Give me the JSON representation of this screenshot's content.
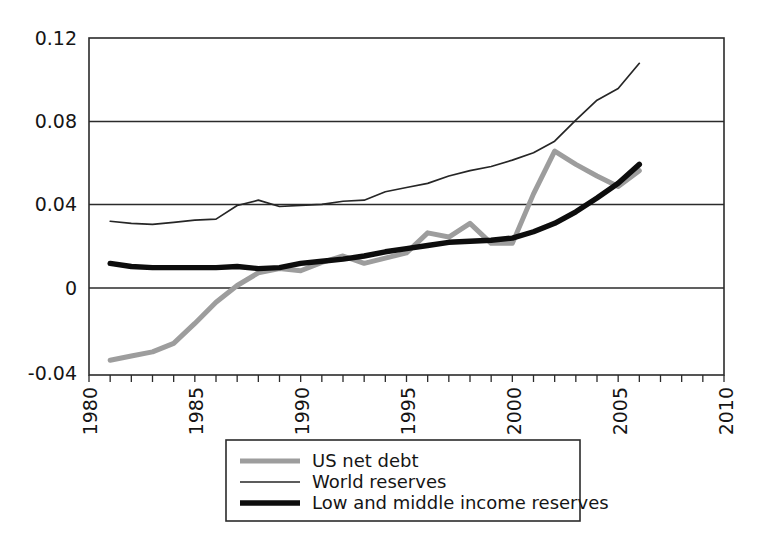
{
  "chart_data": {
    "type": "line",
    "title": "",
    "subtitle": "",
    "xlabel": "",
    "ylabel": "",
    "xlim": [
      1980,
      2010
    ],
    "ylim": [
      -0.04,
      0.12
    ],
    "grid": true,
    "grid_axis": "y",
    "legend_position": "below-center",
    "x_ticks": [
      1980,
      1985,
      1990,
      1995,
      2000,
      2005,
      2010
    ],
    "x_tick_labels": [
      "1980",
      "1985",
      "1990",
      "1995",
      "2000",
      "2005",
      "2010"
    ],
    "x_minor_tick_step": 1,
    "x_tick_label_rotation": 90,
    "y_ticks": [
      -0.04,
      0,
      0.04,
      0.08,
      0.12
    ],
    "y_tick_labels": [
      "-0.04",
      "0",
      "0.04",
      "0.08",
      "0.12"
    ],
    "series": [
      {
        "name": "US net debt",
        "color": "#9d9d9d",
        "width": 5.0,
        "x": [
          1981,
          1982,
          1983,
          1984,
          1985,
          1986,
          1987,
          1988,
          1989,
          1990,
          1991,
          1992,
          1993,
          1994,
          1995,
          1996,
          1997,
          1998,
          1999,
          2000,
          2001,
          2002,
          2003,
          2004,
          2005,
          2006
        ],
        "values": [
          -0.033,
          -0.031,
          -0.029,
          -0.025,
          -0.0155,
          -0.0055,
          0.0025,
          0.0085,
          0.0105,
          0.0095,
          0.0135,
          0.0165,
          0.013,
          0.0155,
          0.018,
          0.0275,
          0.0255,
          0.032,
          0.0225,
          0.0225,
          0.046,
          0.0663,
          0.06,
          0.0545,
          0.0495,
          0.057
        ]
      },
      {
        "name": "World reserves",
        "color": "#262626",
        "width": 1.7,
        "x": [
          1981,
          1982,
          1983,
          1984,
          1985,
          1986,
          1987,
          1988,
          1989,
          1990,
          1991,
          1992,
          1993,
          1994,
          1995,
          1996,
          1997,
          1998,
          1999,
          2000,
          2001,
          2002,
          2003,
          2004,
          2005,
          2006
        ],
        "values": [
          0.033,
          0.032,
          0.0315,
          0.0325,
          0.0335,
          0.034,
          0.0405,
          0.043,
          0.04,
          0.0405,
          0.041,
          0.0425,
          0.043,
          0.047,
          0.049,
          0.051,
          0.0545,
          0.057,
          0.059,
          0.062,
          0.0655,
          0.071,
          0.081,
          0.0905,
          0.096,
          0.108
        ]
      },
      {
        "name": "Low and middle income reserves",
        "color": "#0d0d0d",
        "width": 5.4,
        "x": [
          1981,
          1982,
          1983,
          1984,
          1985,
          1986,
          1987,
          1988,
          1989,
          1990,
          1991,
          1992,
          1993,
          1994,
          1995,
          1996,
          1997,
          1998,
          1999,
          2000,
          2001,
          2002,
          2003,
          2004,
          2005,
          2006
        ],
        "values": [
          0.013,
          0.0115,
          0.011,
          0.011,
          0.011,
          0.011,
          0.0115,
          0.0105,
          0.011,
          0.013,
          0.014,
          0.015,
          0.0165,
          0.0185,
          0.02,
          0.0215,
          0.023,
          0.0235,
          0.024,
          0.025,
          0.028,
          0.032,
          0.0375,
          0.044,
          0.051,
          0.06
        ]
      }
    ]
  },
  "legend": {
    "entries": [
      {
        "label": "US net debt"
      },
      {
        "label": "World reserves"
      },
      {
        "label": "Low and middle income reserves"
      }
    ]
  }
}
